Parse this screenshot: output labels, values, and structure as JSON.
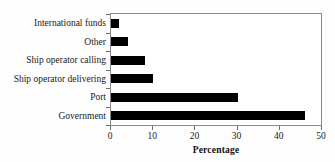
{
  "chart_data": {
    "type": "bar",
    "orientation": "horizontal",
    "title": "",
    "xlabel": "Percentage",
    "ylabel": "",
    "xlim": [
      0,
      50
    ],
    "xticks": [
      0,
      10,
      20,
      30,
      40,
      50
    ],
    "grid": false,
    "legend": null,
    "categories": [
      "International funds",
      "Other",
      "Ship operator calling",
      "Ship operator delivering",
      "Port",
      "Government"
    ],
    "values": [
      2,
      4,
      8,
      10,
      30,
      46
    ],
    "bar_color": "#000000",
    "frame_color": "#8a8a8a",
    "background": "#fdfdfd"
  }
}
